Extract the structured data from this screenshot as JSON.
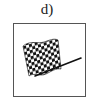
{
  "figure": {
    "label": "d)",
    "icon": "checkered-flag-icon",
    "colors": {
      "border": "#555555",
      "flag_dark": "#111111",
      "flag_light": "#ffffff"
    }
  }
}
